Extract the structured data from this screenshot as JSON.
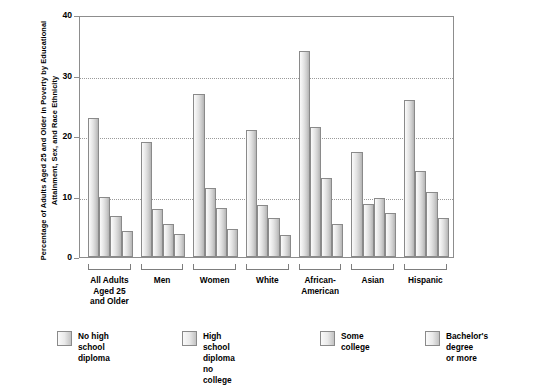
{
  "chart_data": {
    "type": "bar",
    "title": "",
    "ylabel": "Percentage of Adults Aged 25 and Older in Poverty by Educational Attainment, Sex, and Race Ethnicity",
    "xlabel": "",
    "ylim": [
      0,
      40
    ],
    "yticks": [
      0,
      10,
      20,
      30,
      40
    ],
    "grid": true,
    "legend_position": "bottom",
    "categories": [
      "All Adults\nAged 25\nand Older",
      "Men",
      "Women",
      "White",
      "African-\nAmerican",
      "Asian",
      "Hispanic"
    ],
    "series": [
      {
        "name": "No high school diploma",
        "values": [
          23.0,
          19.0,
          27.0,
          21.0,
          34.0,
          17.3,
          26.0
        ]
      },
      {
        "name": "High school diploma\nno college",
        "values": [
          10.0,
          8.0,
          11.4,
          8.6,
          21.5,
          8.8,
          14.3
        ]
      },
      {
        "name": "Some college",
        "values": [
          6.8,
          5.5,
          8.1,
          6.4,
          13.0,
          9.8,
          10.8
        ]
      },
      {
        "name": "Bachelor's degree\nor more",
        "values": [
          4.3,
          3.8,
          4.6,
          3.6,
          5.5,
          7.2,
          6.5
        ]
      }
    ]
  },
  "axis": {
    "y_tick_labels": [
      "0",
      "10",
      "20",
      "30",
      "40"
    ]
  },
  "legend": {
    "items": [
      {
        "label": "No high school diploma"
      },
      {
        "label": "High school diploma\nno college"
      },
      {
        "label": "Some college"
      },
      {
        "label": "Bachelor's degree\nor more"
      }
    ]
  },
  "colors": {
    "bar_light": "#fafafa",
    "bar_dark": "#b4b4b4",
    "axis": "#8d8d8d",
    "grid": "#9a9a9a",
    "text": "#000000"
  }
}
